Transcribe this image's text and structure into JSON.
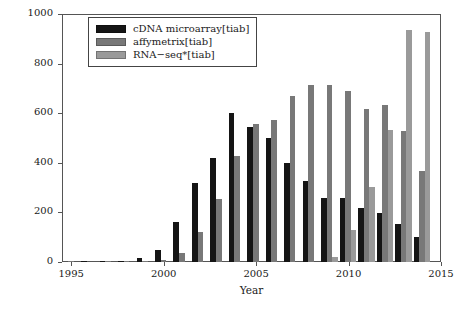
{
  "chart_data": {
    "type": "bar",
    "title": "",
    "xlabel": "Year",
    "ylabel": "Pubmed citation",
    "xlim": [
      1994.5,
      2015.0
    ],
    "ylim": [
      0,
      1000
    ],
    "ytick_labels": [
      "0",
      "200",
      "400",
      "600",
      "800",
      "1000"
    ],
    "ytick_values": [
      0,
      200,
      400,
      600,
      800,
      1000
    ],
    "xtick_labels": [
      "1995",
      "2000",
      "2005",
      "2010",
      "2015"
    ],
    "xtick_values": [
      1995,
      2000,
      2005,
      2010,
      2015
    ],
    "grid": false,
    "legend_position": "upper-left",
    "categories": [
      1995,
      1996,
      1997,
      1998,
      1999,
      2000,
      2001,
      2002,
      2003,
      2004,
      2005,
      2006,
      2007,
      2008,
      2009,
      2010,
      2011,
      2012,
      2013,
      2014
    ],
    "series": [
      {
        "name": "cDNA microarray[tiab]",
        "color": "#151515",
        "values": [
          0,
          1,
          2,
          4,
          16,
          48,
          163,
          320,
          418,
          601,
          544,
          499,
          401,
          327,
          257,
          257,
          216,
          197,
          152,
          100
        ]
      },
      {
        "name": "affymetrix[tiab]",
        "color": "#787878",
        "values": [
          1,
          0,
          1,
          3,
          3,
          10,
          36,
          123,
          254,
          426,
          557,
          571,
          669,
          712,
          712,
          690,
          618,
          635,
          527,
          365
        ]
      },
      {
        "name": "RNA-seq*[tiab]",
        "color": "#9a9a9a",
        "values": [
          0,
          0,
          0,
          0,
          0,
          0,
          0,
          0,
          0,
          0,
          0,
          0,
          0,
          0,
          21,
          128,
          304,
          531,
          934,
          929
        ]
      }
    ]
  },
  "legend": {
    "entries": [
      {
        "label": "cDNA microarray[tiab]",
        "color": "#151515"
      },
      {
        "label": "affymetrix[tiab]",
        "color": "#787878"
      },
      {
        "label": "RNA−seq*[tiab]",
        "color": "#9a9a9a"
      }
    ]
  },
  "axes": {
    "y_title": "Pubmed citation",
    "x_title": "Year"
  }
}
